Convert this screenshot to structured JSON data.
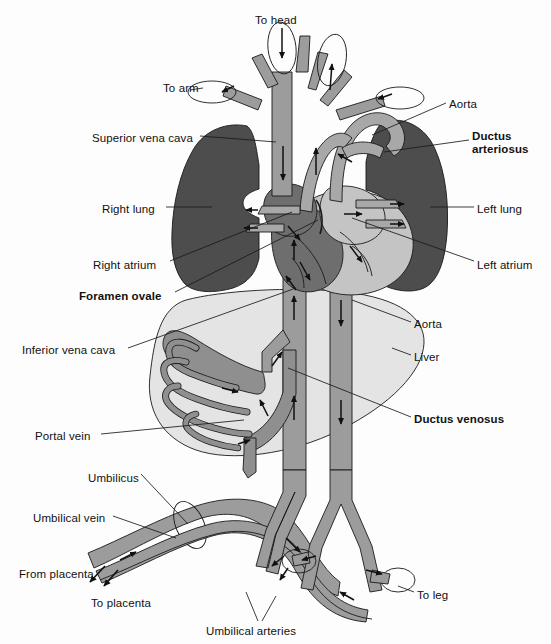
{
  "figure": {
    "type": "anatomical-diagram"
  },
  "colors": {
    "background": "#fdfdfd",
    "lung": "#4d4d4d",
    "vessel_deoxygenated": "#8f8f8f",
    "vessel_mixed": "#a8a8a8",
    "heart_right": "#6e6e6e",
    "heart_left": "#c2c2c2",
    "liver": "#e2e2e2",
    "outline": "#1a1a1a",
    "text": "#111111"
  },
  "labels": [
    {
      "id": "to-head",
      "text": "To head",
      "bold": false,
      "x": 255,
      "y": 14,
      "align": "left"
    },
    {
      "id": "to-arm",
      "text": "To arm",
      "bold": false,
      "x": 163,
      "y": 82,
      "align": "left"
    },
    {
      "id": "aorta-top",
      "text": "Aorta",
      "bold": false,
      "x": 449,
      "y": 98,
      "align": "left"
    },
    {
      "id": "superior-vena-cava",
      "text": "Superior vena cava",
      "bold": false,
      "x": 92,
      "y": 132,
      "align": "left"
    },
    {
      "id": "ductus-arteriosus",
      "text": "Ductus\narteriosus",
      "bold": true,
      "x": 472,
      "y": 130,
      "align": "left"
    },
    {
      "id": "right-lung",
      "text": "Right lung",
      "bold": false,
      "x": 102,
      "y": 203,
      "align": "left"
    },
    {
      "id": "left-lung",
      "text": "Left lung",
      "bold": false,
      "x": 477,
      "y": 203,
      "align": "left"
    },
    {
      "id": "right-atrium",
      "text": "Right atrium",
      "bold": false,
      "x": 93,
      "y": 259,
      "align": "left"
    },
    {
      "id": "left-atrium",
      "text": "Left atrium",
      "bold": false,
      "x": 477,
      "y": 259,
      "align": "left"
    },
    {
      "id": "foramen-ovale",
      "text": "Foramen ovale",
      "bold": true,
      "x": 79,
      "y": 290,
      "align": "left"
    },
    {
      "id": "aorta-lower",
      "text": "Aorta",
      "bold": false,
      "x": 414,
      "y": 318,
      "align": "left"
    },
    {
      "id": "inferior-vena-cava",
      "text": "Inferior vena cava",
      "bold": false,
      "x": 22,
      "y": 344,
      "align": "left"
    },
    {
      "id": "liver",
      "text": "Liver",
      "bold": false,
      "x": 414,
      "y": 351,
      "align": "left"
    },
    {
      "id": "ductus-venosus",
      "text": "Ductus venosus",
      "bold": true,
      "x": 414,
      "y": 413,
      "align": "left"
    },
    {
      "id": "portal-vein",
      "text": "Portal vein",
      "bold": false,
      "x": 35,
      "y": 430,
      "align": "left"
    },
    {
      "id": "umbilicus",
      "text": "Umbilicus",
      "bold": false,
      "x": 88,
      "y": 472,
      "align": "left"
    },
    {
      "id": "umbilical-vein",
      "text": "Umbilical vein",
      "bold": false,
      "x": 33,
      "y": 512,
      "align": "left"
    },
    {
      "id": "from-placenta",
      "text": "From placenta",
      "bold": false,
      "x": 19,
      "y": 568,
      "align": "left"
    },
    {
      "id": "to-placenta",
      "text": "To placenta",
      "bold": false,
      "x": 91,
      "y": 597,
      "align": "left"
    },
    {
      "id": "to-leg",
      "text": "To leg",
      "bold": false,
      "x": 417,
      "y": 589,
      "align": "left"
    },
    {
      "id": "umbilical-arteries",
      "text": "Umbilical arteries",
      "bold": false,
      "x": 206,
      "y": 625,
      "align": "left"
    }
  ],
  "structures": [
    {
      "id": "right-lung-shape",
      "name": "Right lung"
    },
    {
      "id": "left-lung-shape",
      "name": "Left lung"
    },
    {
      "id": "liver-shape",
      "name": "Liver"
    },
    {
      "id": "heart-shape",
      "name": "Heart"
    },
    {
      "id": "svc-vessel",
      "name": "Superior vena cava"
    },
    {
      "id": "ivc-vessel",
      "name": "Inferior vena cava"
    },
    {
      "id": "aorta-vessel",
      "name": "Aorta"
    },
    {
      "id": "ductus-arteriosus-vessel",
      "name": "Ductus arteriosus"
    },
    {
      "id": "ductus-venosus-vessel",
      "name": "Ductus venosus"
    },
    {
      "id": "portal-vein-vessel",
      "name": "Portal vein"
    },
    {
      "id": "umbilical-vein-vessel",
      "name": "Umbilical vein"
    },
    {
      "id": "umbilical-arteries-vessel",
      "name": "Umbilical arteries"
    }
  ]
}
